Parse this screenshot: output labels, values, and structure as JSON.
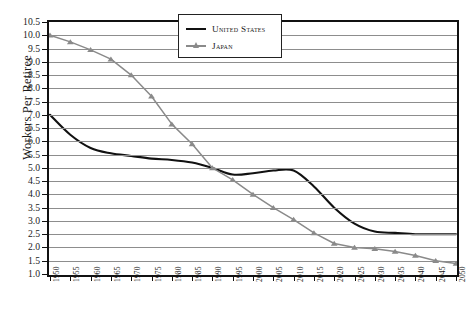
{
  "chart_data": {
    "type": "line",
    "title": "",
    "xlabel": "",
    "ylabel": "Workers Per Retiree",
    "ylim": [
      1.0,
      10.5
    ],
    "ytick_step": 0.5,
    "grid": true,
    "legend_position": "top-center",
    "x": [
      1950,
      1955,
      1960,
      1965,
      1970,
      1975,
      1980,
      1985,
      1990,
      1995,
      2000,
      2005,
      2010,
      2015,
      2020,
      2025,
      2030,
      2035,
      2040,
      2045,
      2050
    ],
    "yticks": [
      "1.0",
      "1.5",
      "2.0",
      "2.5",
      "3.0",
      "3.5",
      "4.0",
      "4.5",
      "5.0",
      "5.5",
      "6.0",
      "6.5",
      "7.0",
      "7.5",
      "8.0",
      "8.5",
      "9.0",
      "9.5",
      "10.0",
      "10.5"
    ],
    "xticks": [
      "1950",
      "1955",
      "1960",
      "1965",
      "1970",
      "1975",
      "1980",
      "1985",
      "1990",
      "1995",
      "2000",
      "2005",
      "2010",
      "2015",
      "2020",
      "2025",
      "2030",
      "2035",
      "2040",
      "2045",
      "2050"
    ],
    "series": [
      {
        "name": "United States",
        "color": "#111111",
        "marker": "none",
        "values": [
          7.0,
          6.25,
          5.75,
          5.55,
          5.45,
          5.35,
          5.3,
          5.2,
          5.0,
          4.75,
          4.8,
          4.9,
          4.9,
          4.3,
          3.5,
          2.9,
          2.6,
          2.55,
          2.5,
          2.5,
          2.5
        ]
      },
      {
        "name": "Japan",
        "color": "#8a8a8a",
        "marker": "triangle",
        "values": [
          10.0,
          9.75,
          9.45,
          9.1,
          8.5,
          7.7,
          6.65,
          5.9,
          5.0,
          4.55,
          4.0,
          3.5,
          3.05,
          2.55,
          2.15,
          2.0,
          1.95,
          1.85,
          1.7,
          1.5,
          1.4
        ]
      }
    ]
  },
  "legend": {
    "items": [
      {
        "label": "United States"
      },
      {
        "label": "Japan"
      }
    ]
  },
  "axis": {
    "y_title": "Workers Per Retiree"
  }
}
